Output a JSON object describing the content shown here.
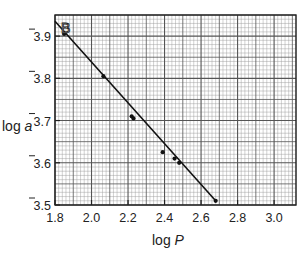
{
  "chart_data": {
    "type": "scatter",
    "panel_label": "B",
    "title": "",
    "xlabel": "log P",
    "xlabel_parts": {
      "prefix": "log ",
      "var": "P"
    },
    "ylabel": "log a",
    "ylabel_parts": {
      "prefix": "log ",
      "var": "a"
    },
    "xlim": [
      1.8,
      3.12
    ],
    "ylim": [
      3.5,
      3.95
    ],
    "x_ticks": [
      1.8,
      2.0,
      2.2,
      2.4,
      2.6,
      2.8,
      3.0
    ],
    "x_tick_labels": [
      "1.8",
      "2.0",
      "2.2",
      "2.4",
      "2.6",
      "2.8",
      "3.0"
    ],
    "y_ticks": [
      3.5,
      3.6,
      3.7,
      3.8,
      3.9
    ],
    "y_tick_labels": [
      "3.5",
      "3.6",
      "3.7",
      "3.8",
      "3.9"
    ],
    "y_tick_label_note": "bar-notation (negative characteristic), rendered as 3̄",
    "grid": true,
    "grid_style": "graph paper: major every 0.1 in x / 0.05 in y, minor every 0.02 in x / 0.01 in y",
    "legend": null,
    "series": [
      {
        "name": "observations",
        "kind": "points",
        "x": [
          1.85,
          2.065,
          2.22,
          2.23,
          2.39,
          2.455,
          2.48,
          2.68
        ],
        "y": [
          3.905,
          3.805,
          3.71,
          3.705,
          3.625,
          3.61,
          3.6,
          3.51
        ]
      },
      {
        "name": "fitted line",
        "kind": "line",
        "x": [
          1.8,
          2.68
        ],
        "y": [
          3.935,
          3.51
        ]
      }
    ]
  },
  "colors": {
    "background": "#ffffff",
    "grid_minor": "#9a9a9a",
    "grid_major": "#555555",
    "axis": "#222222",
    "data": "#111111"
  }
}
